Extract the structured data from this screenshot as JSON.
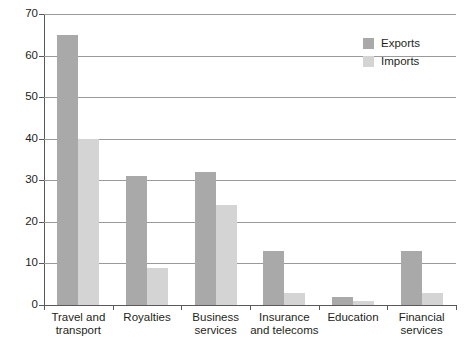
{
  "chart_data": {
    "type": "bar",
    "title": "",
    "subtitle": "",
    "xlabel": "",
    "ylabel": "",
    "ylim": [
      0,
      70
    ],
    "yticks": [
      0,
      10,
      20,
      30,
      40,
      50,
      60,
      70
    ],
    "ytick_labels": [
      "0",
      "10",
      "20",
      "30",
      "40",
      "50",
      "60",
      "70"
    ],
    "grid": true,
    "legend_position": "top-right",
    "categories": [
      "Travel and transport",
      "Royalties",
      "Business services",
      "Insurance and telecoms",
      "Education",
      "Financial services"
    ],
    "category_lines": [
      [
        "Travel and",
        "transport"
      ],
      [
        "Royalties"
      ],
      [
        "Business",
        "services"
      ],
      [
        "Insurance",
        "and telecoms"
      ],
      [
        "Education"
      ],
      [
        "Financial",
        "services"
      ]
    ],
    "series": [
      {
        "name": "Exports",
        "color": "#a9a9a9",
        "values": [
          65,
          31,
          32,
          13,
          2,
          13
        ]
      },
      {
        "name": "Imports",
        "color": "#d4d4d4",
        "values": [
          40,
          9,
          24,
          3,
          1,
          3
        ]
      }
    ]
  },
  "legend": {
    "items": [
      {
        "label": "Exports",
        "color": "#a9a9a9"
      },
      {
        "label": "Imports",
        "color": "#d4d4d4"
      }
    ]
  }
}
